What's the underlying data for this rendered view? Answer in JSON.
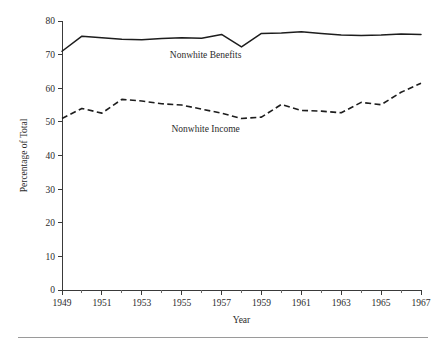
{
  "chart_data": {
    "type": "line",
    "title": "",
    "subtitle": "",
    "xlabel": "Year",
    "ylabel": "Percentage of Total",
    "xlim": [
      1949,
      1967
    ],
    "ylim": [
      0,
      80
    ],
    "grid": false,
    "legend_position": "inline-annotation",
    "y_ticks": [
      0,
      10,
      20,
      30,
      40,
      50,
      60,
      70,
      80
    ],
    "y_tick_labels": [
      "0",
      "10",
      "20",
      "30",
      "40",
      "50",
      "60",
      "70",
      "80"
    ],
    "x_ticks": [
      1949,
      1951,
      1953,
      1955,
      1957,
      1959,
      1961,
      1963,
      1965,
      1967
    ],
    "x_tick_labels": [
      "1949",
      "1951",
      "1953",
      "1955",
      "1957",
      "1959",
      "1961",
      "1963",
      "1965",
      "1967"
    ],
    "x_minor_ticks": [
      1950,
      1952,
      1954,
      1956,
      1958,
      1960,
      1962,
      1964,
      1966
    ],
    "x": [
      1949,
      1950,
      1951,
      1952,
      1953,
      1954,
      1955,
      1956,
      1957,
      1958,
      1959,
      1960,
      1961,
      1962,
      1963,
      1964,
      1965,
      1966,
      1967
    ],
    "series": [
      {
        "name": "Nonwhite Benefits",
        "style": "solid",
        "color": "#1d1d1d",
        "label_x": 1956.2,
        "label_y": 69.0,
        "values": [
          71.0,
          75.5,
          75.0,
          74.6,
          74.4,
          74.8,
          75.0,
          74.9,
          76.0,
          72.3,
          76.3,
          76.4,
          76.8,
          76.3,
          75.8,
          75.7,
          75.8,
          76.1,
          76.0
        ]
      },
      {
        "name": "Nonwhite Income",
        "style": "dashed",
        "color": "#1d1d1d",
        "label_x": 1956.2,
        "label_y": 47.0,
        "values": [
          51.0,
          54.0,
          52.6,
          56.7,
          56.2,
          55.4,
          55.0,
          53.8,
          52.6,
          51.0,
          51.4,
          55.2,
          53.4,
          53.2,
          52.7,
          55.8,
          55.1,
          58.8,
          61.5
        ]
      }
    ],
    "annotations": [
      {
        "text": "Nonwhite Benefits",
        "x": 1956.2,
        "y": 69.0
      },
      {
        "text": "Nonwhite Income",
        "x": 1956.2,
        "y": 47.0
      }
    ]
  },
  "figure": {
    "footer_rule_visible": true
  }
}
